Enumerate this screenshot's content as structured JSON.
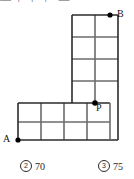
{
  "header": {
    "fragment_text": "— ⌐ ⌐ ⌐ —"
  },
  "figure": {
    "name": "lattice-path-diagram",
    "points": [
      {
        "id": "A",
        "label": "A",
        "x": 18,
        "y": 140
      },
      {
        "id": "B",
        "label": "B",
        "x": 110,
        "y": 15
      },
      {
        "id": "P",
        "label": "P",
        "x": 95,
        "y": 103
      }
    ],
    "colors": {
      "grid_line": "#6b6b6b",
      "outline": "#2b2b2b",
      "point": "#000000",
      "background": "#ffffff"
    },
    "geometry": {
      "cell_size": 23,
      "horizontal_block": {
        "cols": 4,
        "rows": 2,
        "left": 18,
        "top": 103,
        "right": 110,
        "bottom": 140
      },
      "vertical_block": {
        "cols": 2,
        "rows": 4,
        "left": 72,
        "top": 15,
        "right": 118,
        "bottom": 103
      }
    }
  },
  "options": [
    {
      "marker": "2",
      "label": "70"
    },
    {
      "marker": "3",
      "label": "75"
    }
  ]
}
